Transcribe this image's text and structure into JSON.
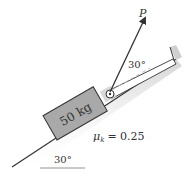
{
  "diagram": {
    "type": "mechanics-free-body-setup",
    "block": {
      "label": "50 kg",
      "fill": "#a9a9a9"
    },
    "force": {
      "label": "P",
      "angle_label": "30°"
    },
    "friction": {
      "symbol": "μ",
      "subscript": "k",
      "equals": "= 0.25"
    },
    "incline": {
      "angle_label": "30°"
    },
    "colors": {
      "line": "#333333",
      "block": "#a9a9a9",
      "strip": "#ffffff",
      "shadow": "#cfcfcf",
      "dashed": "#bbbbbb"
    }
  }
}
